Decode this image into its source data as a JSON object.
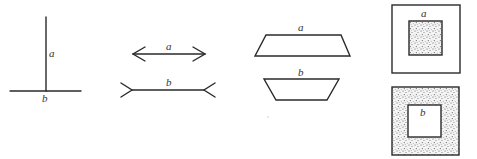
{
  "figure": {
    "panels": [
      {
        "id": "vertical-horizontal",
        "name": "Vertical-horizontal illusion",
        "labels": {
          "a": "a",
          "b": "b"
        }
      },
      {
        "id": "muller-lyer",
        "name": "Müller-Lyer illusion",
        "labels": {
          "a": "a",
          "b": "b"
        }
      },
      {
        "id": "trapezoids",
        "name": "Trapezoid size illusion",
        "labels": {
          "a": "a",
          "b": "b"
        }
      },
      {
        "id": "squares",
        "name": "Surround contrast squares",
        "labels": {
          "a": "a",
          "b": "b"
        }
      }
    ],
    "colors": {
      "stroke": "#2a2a2a",
      "stipple": "#555555",
      "background": "#ffffff"
    }
  }
}
